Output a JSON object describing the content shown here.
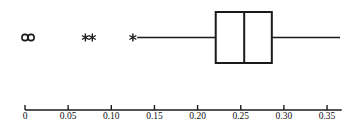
{
  "figure": {
    "title": "",
    "background_color": "#ffffff",
    "line_color": "#1a1a1a",
    "width": 352,
    "height": 135
  },
  "chart_data": {
    "type": "box",
    "orientation": "horizontal",
    "title": "",
    "xlabel": "",
    "ylabel": "",
    "xlim": [
      0.0,
      0.367
    ],
    "grid": false,
    "legend": null,
    "axis": {
      "tick_values": [
        0.0,
        0.05,
        0.1,
        0.15,
        0.2,
        0.25,
        0.3,
        0.35
      ],
      "tick_labels": [
        "0",
        "0.05",
        "0.10",
        "0.15",
        "0.20",
        "0.25",
        "0.30",
        "0.35"
      ],
      "tick_direction": "up",
      "line_visible": true
    },
    "series": [
      {
        "name": "box-1",
        "whisker_low": 0.13,
        "q1": 0.221,
        "median": 0.254,
        "q3": 0.286,
        "whisker_high": 0.365,
        "outliers_mild": [
          0.07,
          0.078,
          0.125
        ],
        "outliers_extreme": [
          0.0,
          0.007
        ],
        "mild_marker": "asterisk",
        "extreme_marker": "circle"
      }
    ]
  }
}
